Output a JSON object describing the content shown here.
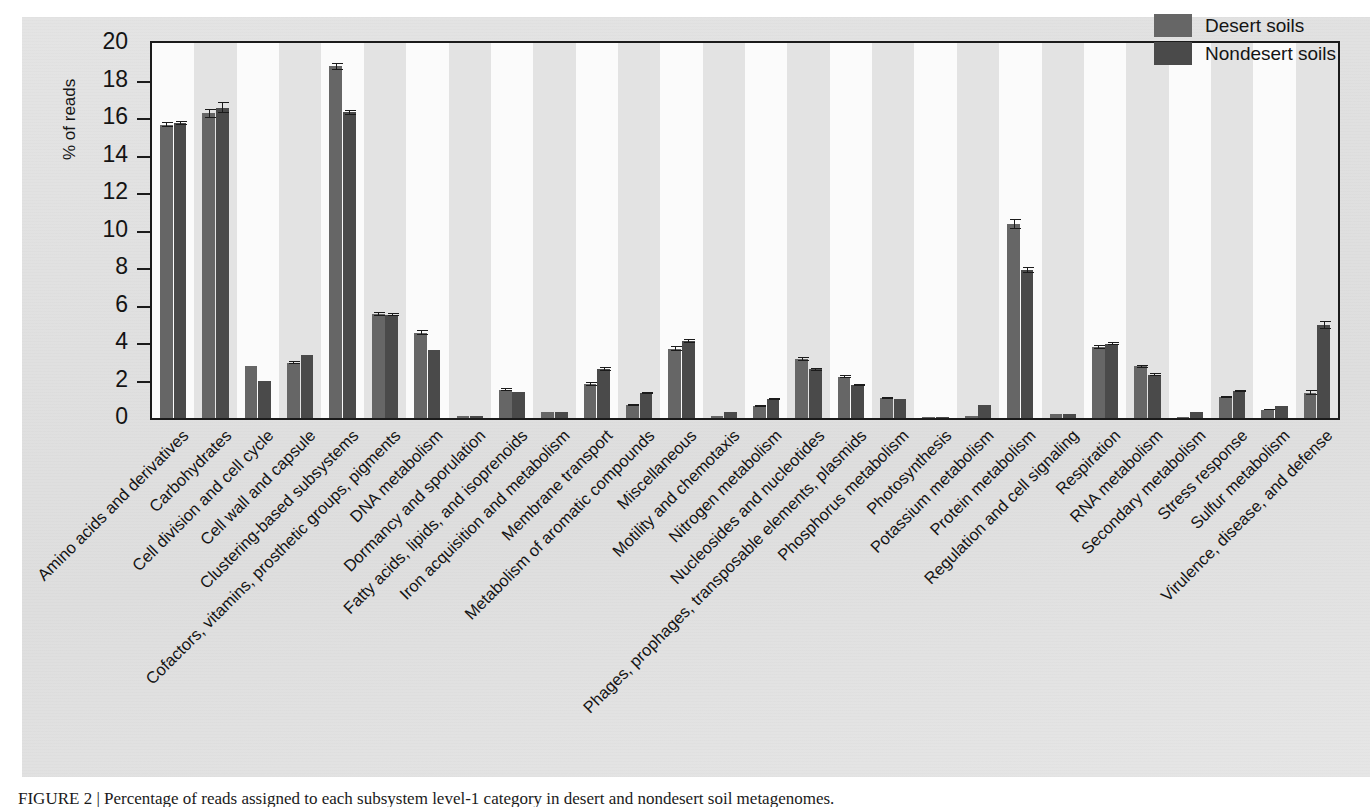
{
  "figure": {
    "caption": "FIGURE 2 | Percentage of reads assigned to each subsystem level-1 category in desert and nondesert soil metagenomes."
  },
  "legend": {
    "position": "top-right",
    "entries": [
      {
        "label": "Desert soils",
        "color": "#666666"
      },
      {
        "label": "Nondesert soils",
        "color": "#4a4a4a"
      }
    ]
  },
  "axes": {
    "ylabel": "% of reads",
    "yticks": [
      "0",
      "2",
      "4",
      "6",
      "8",
      "10",
      "12",
      "14",
      "16",
      "18",
      "20"
    ],
    "ylim": [
      0,
      20
    ],
    "xlabel": ""
  },
  "chart_data": {
    "type": "bar",
    "title": "",
    "xlabel": "",
    "ylabel": "% of reads",
    "ylim": [
      0,
      20
    ],
    "grid": false,
    "legend_position": "top-right",
    "categories": [
      "Amino acids and derivatives",
      "Carbohydrates",
      "Cell division and cell cycle",
      "Cell wall and capsule",
      "Clustering-based subsystems",
      "Cofactors, vitamins, prosthetic groups, pigments",
      "DNA metabolism",
      "Dormancy and sporulation",
      "Fatty acids, lipids, and isoprenoids",
      "Iron acquisition and metabolism",
      "Membrane transport",
      "Metabolism of aromatic compounds",
      "Miscellaneous",
      "Motility and chemotaxis",
      "Nitrogen metabolism",
      "Nucleosides and nucleotides",
      "Phages, prophages, transposable elements, plasmids",
      "Phosphorus metabolism",
      "Photosynthesis",
      "Potassium metabolism",
      "Protein metabolism",
      "Regulation and cell signaling",
      "Respiration",
      "RNA metabolism",
      "Secondary metabolism",
      "Stress response",
      "Sulfur metabolism",
      "Virulence, disease, and defense"
    ],
    "series": [
      {
        "name": "Desert soils",
        "color": "#666666",
        "values": [
          15.65,
          16.25,
          2.75,
          2.95,
          18.75,
          5.55,
          4.55,
          0.1,
          1.5,
          0.3,
          1.8,
          0.7,
          3.7,
          0.1,
          0.65,
          3.15,
          2.2,
          1.05,
          0.08,
          0.12,
          10.35,
          0.2,
          3.8,
          2.75,
          0.05,
          1.1,
          0.45,
          1.35
        ],
        "errors": [
          0.12,
          0.25,
          0.0,
          0.08,
          0.18,
          0.1,
          0.12,
          0.0,
          0.08,
          0.0,
          0.1,
          0.05,
          0.12,
          0.0,
          0.05,
          0.1,
          0.08,
          0.05,
          0.0,
          0.0,
          0.25,
          0.0,
          0.1,
          0.1,
          0.0,
          0.05,
          0.03,
          0.12
        ]
      },
      {
        "name": "Nondesert soils",
        "color": "#4a4a4a",
        "values": [
          15.75,
          16.55,
          1.95,
          3.35,
          16.3,
          5.5,
          3.65,
          0.12,
          1.4,
          0.32,
          2.6,
          1.35,
          4.1,
          0.3,
          1.0,
          2.6,
          1.75,
          1.0,
          0.08,
          0.7,
          7.9,
          0.22,
          3.95,
          2.3,
          0.3,
          1.45,
          0.65,
          4.95
        ],
        "errors": [
          0.1,
          0.28,
          0.0,
          0.0,
          0.15,
          0.08,
          0.0,
          0.0,
          0.0,
          0.0,
          0.1,
          0.05,
          0.12,
          0.0,
          0.05,
          0.08,
          0.06,
          0.0,
          0.0,
          0.0,
          0.18,
          0.0,
          0.08,
          0.08,
          0.0,
          0.05,
          0.0,
          0.2
        ]
      }
    ]
  },
  "colors": {
    "desert": "#666666",
    "nondesert": "#4a4a4a",
    "stripe": "#e3e3e3",
    "plot_bg": "#fbfbfb",
    "axis": "#1b1b1b",
    "page_bg": "#e2e2e2"
  }
}
